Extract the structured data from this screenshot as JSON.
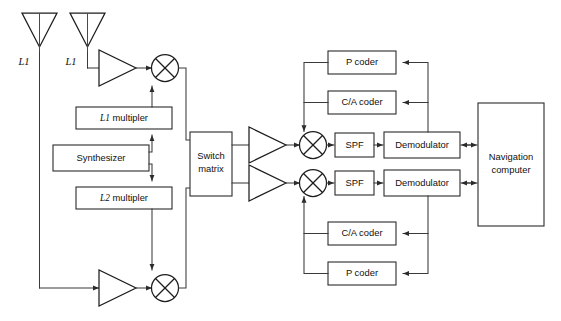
{
  "diagram": {
    "colors": {
      "background": "#ffffff",
      "wire": "#3a3a3a",
      "block_stroke": "#2b2b2b",
      "text": "#101010"
    },
    "antennas": [
      {
        "id": "antenna-left",
        "label": "L1"
      },
      {
        "id": "antenna-right",
        "label": "L1"
      }
    ],
    "blocks": {
      "l1_multiplier": "L1 multipler",
      "l1_multiplier_italic_prefix": "L1",
      "l1_multiplier_rest": " multipler",
      "synthesizer": "Synthesizer",
      "l2_multiplier": "L2 multipler",
      "l2_multiplier_italic_prefix": "L2",
      "l2_multiplier_rest": " multipler",
      "switch_matrix_line1": "Switch",
      "switch_matrix_line2": "matrix",
      "spf_upper": "SPF",
      "spf_lower": "SPF",
      "demodulator_upper": "Demodulator",
      "demodulator_lower": "Demodulator",
      "p_coder_upper": "P coder",
      "ca_coder_upper": "C/A coder",
      "ca_coder_lower": "C/A coder",
      "p_coder_lower": "P coder",
      "navigation_computer_line1": "Navigation",
      "navigation_computer_line2": "computer"
    },
    "symbols": {
      "amplifier_upper_left": "amplifier-triangle",
      "amplifier_lower_left": "amplifier-triangle",
      "amplifier_upper_right": "amplifier-triangle",
      "amplifier_lower_right": "amplifier-triangle",
      "mixer_upper_left": "mixer-circle-x",
      "mixer_lower_left": "mixer-circle-x",
      "mixer_upper_right": "mixer-circle-x",
      "mixer_lower_right": "mixer-circle-x"
    }
  }
}
